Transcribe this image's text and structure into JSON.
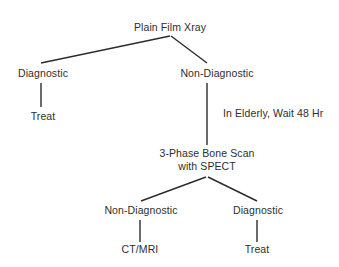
{
  "diagram": {
    "text_color": "#2e2e2e",
    "edge_color": "#2b2b2b",
    "background_color": "#ffffff",
    "nodes": {
      "root": {
        "label": "Plain Film Xray"
      },
      "xray_diagnostic": {
        "label": "Diagnostic"
      },
      "xray_diagnostic_treat": {
        "label": "Treat"
      },
      "xray_nondiagnostic": {
        "label": "Non-Diagnostic"
      },
      "wait_note": {
        "label": "In Elderly, Wait 48 Hr"
      },
      "bone_scan": {
        "line1": "3-Phase Bone Scan",
        "line2": "with SPECT"
      },
      "scan_nondiagnostic": {
        "label": "Non-Diagnostic"
      },
      "scan_nondiagnostic_ctmri": {
        "label": "CT/MRI"
      },
      "scan_diagnostic": {
        "label": "Diagnostic"
      },
      "scan_diagnostic_treat": {
        "label": "Treat"
      }
    },
    "edges": [
      {
        "name": "root-to-xray-diagnostic",
        "x1": 170,
        "y1": 36,
        "x2": 41,
        "y2": 63
      },
      {
        "name": "root-to-xray-nondiagnostic",
        "x1": 171,
        "y1": 36,
        "x2": 207,
        "y2": 63
      },
      {
        "name": "xray-diagnostic-to-treat",
        "x1": 41,
        "y1": 83,
        "x2": 41,
        "y2": 107
      },
      {
        "name": "xray-nondiagnostic-to-bone-scan",
        "x1": 207,
        "y1": 83,
        "x2": 207,
        "y2": 145
      },
      {
        "name": "bone-scan-to-scan-nondiagnostic",
        "x1": 206,
        "y1": 177,
        "x2": 141,
        "y2": 201
      },
      {
        "name": "bone-scan-to-scan-diagnostic",
        "x1": 208,
        "y1": 177,
        "x2": 257,
        "y2": 201
      },
      {
        "name": "scan-nondiagnostic-to-ctmri",
        "x1": 140,
        "y1": 220,
        "x2": 140,
        "y2": 242
      },
      {
        "name": "scan-diagnostic-to-treat",
        "x1": 257,
        "y1": 220,
        "x2": 257,
        "y2": 242
      }
    ]
  }
}
